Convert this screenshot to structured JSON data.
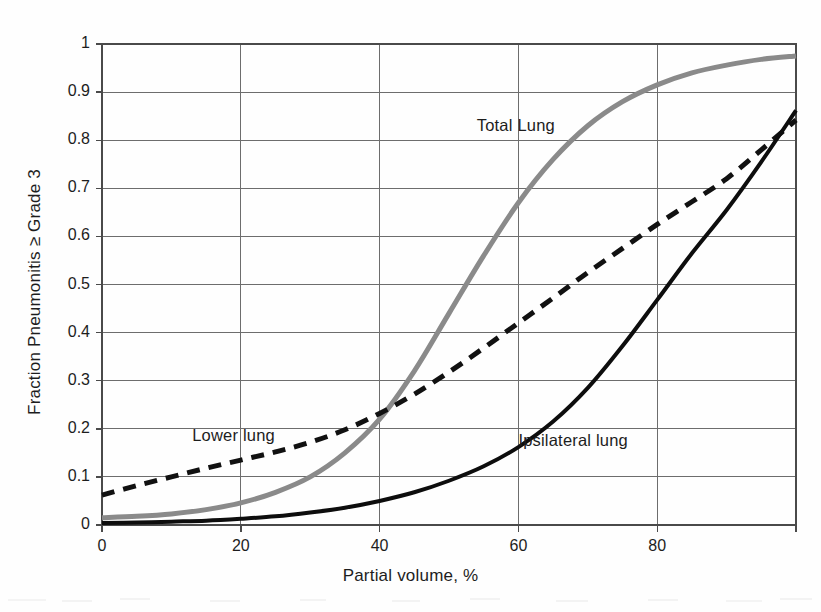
{
  "figure": {
    "background_color": "#fefefe",
    "plot_area": {
      "left": 102,
      "top": 44,
      "right": 796,
      "bottom": 525
    }
  },
  "axes": {
    "x_title": "Partial volume, %",
    "y_title": "Fraction Pneumonitis ≥ Grade 3",
    "x_ticks": [
      "0",
      "20",
      "40",
      "60",
      "80"
    ],
    "y_ticks": [
      "0",
      "0.1",
      "0.2",
      "0.3",
      "0.4",
      "0.5",
      "0.6",
      "0.7",
      "0.8",
      "0.9",
      "1"
    ]
  },
  "labels": {
    "total_lung": "Total Lung",
    "lower_lung": "Lower lung",
    "ipsilateral_lung": "Ipsilateral lung"
  },
  "colors": {
    "total_lung": "#8a8a8a",
    "lower_lung": "#111111",
    "ipsilateral_lung": "#0d0d0d",
    "gridline": "#6d6d6d",
    "frame": "#4a4a4a",
    "text": "#1d1d1d"
  },
  "chart_data": {
    "type": "line",
    "title": "",
    "subtitle": "",
    "xlabel": "Partial volume, %",
    "ylabel": "Fraction Pneumonitis ≥ Grade 3",
    "xlim": [
      0,
      100
    ],
    "ylim": [
      0,
      1
    ],
    "xticks": [
      0,
      20,
      40,
      60,
      80
    ],
    "yticks": [
      0,
      0.1,
      0.2,
      0.3,
      0.4,
      0.5,
      0.6,
      0.7,
      0.8,
      0.9,
      1
    ],
    "grid": true,
    "legend": "inline-annotations",
    "x": [
      0,
      5,
      10,
      15,
      20,
      25,
      30,
      35,
      40,
      45,
      50,
      55,
      60,
      65,
      70,
      75,
      80,
      85,
      90,
      95,
      100
    ],
    "series": [
      {
        "name": "Total Lung",
        "style": "solid",
        "color": "#8a8a8a",
        "linewidth": 5,
        "label_position": {
          "x": 54,
          "y": 0.83
        },
        "values": [
          0.015,
          0.018,
          0.023,
          0.032,
          0.046,
          0.068,
          0.1,
          0.15,
          0.22,
          0.32,
          0.44,
          0.56,
          0.67,
          0.76,
          0.83,
          0.88,
          0.915,
          0.94,
          0.956,
          0.968,
          0.975
        ]
      },
      {
        "name": "Lower lung",
        "style": "dashed",
        "color": "#111111",
        "linewidth": 5,
        "label_position": {
          "x": 13,
          "y": 0.185
        },
        "values": [
          0.062,
          0.082,
          0.1,
          0.118,
          0.135,
          0.152,
          0.172,
          0.198,
          0.232,
          0.272,
          0.318,
          0.368,
          0.42,
          0.472,
          0.525,
          0.575,
          0.625,
          0.672,
          0.72,
          0.78,
          0.842
        ]
      },
      {
        "name": "Ipsilateral lung",
        "style": "solid",
        "color": "#0d0d0d",
        "linewidth": 4,
        "label_position": {
          "x": 60,
          "y": 0.175
        },
        "values": [
          0.004,
          0.005,
          0.007,
          0.009,
          0.013,
          0.018,
          0.026,
          0.036,
          0.05,
          0.068,
          0.092,
          0.122,
          0.162,
          0.215,
          0.285,
          0.372,
          0.468,
          0.565,
          0.655,
          0.755,
          0.862
        ]
      }
    ],
    "annotations": [
      {
        "text": "Total Lung",
        "x": 54,
        "y": 0.83
      },
      {
        "text": "Lower lung",
        "x": 13,
        "y": 0.185
      },
      {
        "text": "Ipsilateral lung",
        "x": 60,
        "y": 0.175
      }
    ]
  }
}
